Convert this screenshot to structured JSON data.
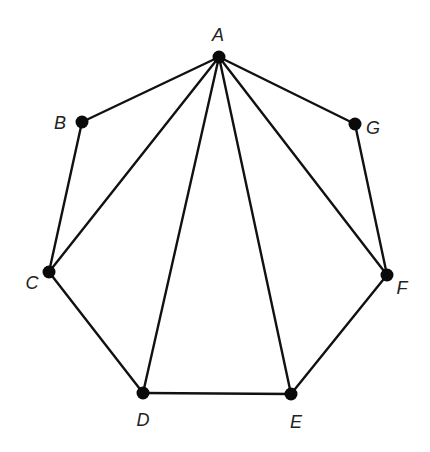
{
  "diagram": {
    "type": "polygon-triangulation",
    "vertices": [
      {
        "id": "A",
        "label": "A",
        "x": 219,
        "y": 57,
        "label_x": 218,
        "label_y": 41
      },
      {
        "id": "B",
        "label": "B",
        "x": 82,
        "y": 122,
        "label_x": 60,
        "label_y": 129
      },
      {
        "id": "C",
        "label": "C",
        "x": 49,
        "y": 272,
        "label_x": 32,
        "label_y": 289
      },
      {
        "id": "D",
        "label": "D",
        "x": 143,
        "y": 393,
        "label_x": 143,
        "label_y": 426
      },
      {
        "id": "E",
        "label": "E",
        "x": 291,
        "y": 394,
        "label_x": 296,
        "label_y": 428
      },
      {
        "id": "F",
        "label": "F",
        "x": 387,
        "y": 275,
        "label_x": 402,
        "label_y": 294
      },
      {
        "id": "G",
        "label": "G",
        "x": 355,
        "y": 124,
        "label_x": 373,
        "label_y": 134
      }
    ],
    "edges": [
      {
        "from": "A",
        "to": "B",
        "kind": "side"
      },
      {
        "from": "B",
        "to": "C",
        "kind": "side"
      },
      {
        "from": "C",
        "to": "D",
        "kind": "side"
      },
      {
        "from": "D",
        "to": "E",
        "kind": "side"
      },
      {
        "from": "E",
        "to": "F",
        "kind": "side"
      },
      {
        "from": "F",
        "to": "G",
        "kind": "side"
      },
      {
        "from": "G",
        "to": "A",
        "kind": "side"
      },
      {
        "from": "A",
        "to": "C",
        "kind": "diagonal"
      },
      {
        "from": "A",
        "to": "D",
        "kind": "diagonal"
      },
      {
        "from": "A",
        "to": "E",
        "kind": "diagonal"
      },
      {
        "from": "A",
        "to": "F",
        "kind": "diagonal"
      }
    ],
    "colors": {
      "line": "#111111",
      "vertex": "#0a0a0a",
      "label": "#222222",
      "background": "#ffffff"
    },
    "vertex_radius": 6.5
  }
}
